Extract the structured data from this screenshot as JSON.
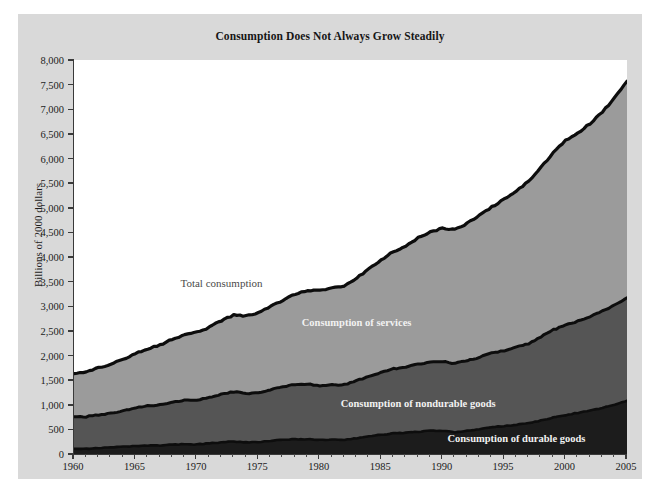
{
  "chart_data": {
    "type": "area",
    "stacked": true,
    "title": "Consumption Does Not Always Grow Steadily",
    "xlabel": "",
    "ylabel": "Billions of 2000 dollars",
    "xlim": [
      1960,
      2005
    ],
    "ylim": [
      0,
      8000
    ],
    "ytick_labels": [
      "0",
      "500",
      "1,000",
      "1,500",
      "2,000",
      "2,500",
      "3,000",
      "3,500",
      "4,000",
      "4,500",
      "5,000",
      "5,500",
      "6,000",
      "6,500",
      "7,000",
      "7,500",
      "8,000"
    ],
    "ytick_values": [
      0,
      500,
      1000,
      1500,
      2000,
      2500,
      3000,
      3500,
      4000,
      4500,
      5000,
      5500,
      6000,
      6500,
      7000,
      7500,
      8000
    ],
    "xtick_labels": [
      "1960",
      "1965",
      "1970",
      "1975",
      "1980",
      "1985",
      "1990",
      "1995",
      "2000",
      "2005"
    ],
    "xtick_values": [
      1960,
      1965,
      1970,
      1975,
      1980,
      1985,
      1990,
      1995,
      2000,
      2005
    ],
    "grid": false,
    "legend_position": "inline-annotations",
    "x": [
      1960,
      1961,
      1962,
      1963,
      1964,
      1965,
      1966,
      1967,
      1968,
      1969,
      1970,
      1971,
      1972,
      1973,
      1974,
      1975,
      1976,
      1977,
      1978,
      1979,
      1980,
      1981,
      1982,
      1983,
      1984,
      1985,
      1986,
      1987,
      1988,
      1989,
      1990,
      1991,
      1992,
      1993,
      1994,
      1995,
      1996,
      1997,
      1998,
      1999,
      2000,
      2001,
      2002,
      2003,
      2004,
      2005
    ],
    "series": [
      {
        "name": "Consumption of durable goods",
        "color": "#1c1c1c",
        "values": [
          110,
          108,
          120,
          132,
          145,
          160,
          170,
          172,
          190,
          198,
          195,
          215,
          238,
          255,
          238,
          240,
          265,
          288,
          300,
          302,
          285,
          290,
          288,
          320,
          360,
          390,
          420,
          430,
          455,
          470,
          468,
          445,
          468,
          505,
          545,
          565,
          595,
          625,
          680,
          740,
          790,
          835,
          880,
          935,
          1000,
          1080
        ]
      },
      {
        "name": "Consumption of nondurable goods",
        "color": "#555555",
        "values": [
          640,
          650,
          675,
          695,
          730,
          770,
          810,
          825,
          865,
          890,
          905,
          930,
          975,
          1010,
          990,
          1000,
          1045,
          1075,
          1110,
          1120,
          1105,
          1115,
          1120,
          1170,
          1215,
          1265,
          1310,
          1330,
          1370,
          1400,
          1410,
          1395,
          1425,
          1460,
          1505,
          1535,
          1575,
          1620,
          1700,
          1780,
          1830,
          1860,
          1910,
          1965,
          2030,
          2090
        ]
      },
      {
        "name": "Consumption of services",
        "color": "#9b9b9b",
        "values": [
          880,
          905,
          950,
          990,
          1050,
          1105,
          1160,
          1210,
          1275,
          1330,
          1375,
          1425,
          1495,
          1555,
          1575,
          1620,
          1690,
          1760,
          1840,
          1905,
          1930,
          1960,
          1995,
          2085,
          2175,
          2290,
          2380,
          2460,
          2560,
          2640,
          2705,
          2720,
          2790,
          2880,
          2970,
          3070,
          3175,
          3290,
          3440,
          3595,
          3740,
          3825,
          3920,
          4040,
          4210,
          4400
        ]
      }
    ],
    "totals_label": "Total consumption",
    "totals": [
      1630,
      1663,
      1745,
      1817,
      1925,
      2035,
      2140,
      2207,
      2330,
      2418,
      2475,
      2570,
      2708,
      2820,
      2803,
      2860,
      3000,
      3123,
      3250,
      3327,
      3320,
      3365,
      3403,
      3575,
      3750,
      3945,
      4110,
      4220,
      4385,
      4510,
      4583,
      4560,
      4683,
      4845,
      5020,
      5170,
      5345,
      5535,
      5820,
      6115,
      6360,
      6520,
      6710,
      6940,
      7240,
      7570
    ],
    "annotations": [
      {
        "text": "Total consumption",
        "x": 1972,
        "y": 3480
      },
      {
        "text": "Consumption of services",
        "x": 1983,
        "y": 2680
      },
      {
        "text": "Consumption of nondurable goods",
        "x": 1988,
        "y": 1030
      },
      {
        "text": "Consumption of durable goods",
        "x": 1996,
        "y": 330
      }
    ]
  },
  "colors": {
    "panel_background": "#d9d9d9",
    "plot_background": "#ffffff",
    "axis": "#3a3a3a",
    "durable": "#1c1c1c",
    "nondurable": "#555555",
    "services": "#9b9b9b",
    "outline": "#0d0d0d",
    "title_text": "#161616",
    "label_text_light": "#f2f2f2",
    "label_text_dark": "#4a4a4a"
  }
}
